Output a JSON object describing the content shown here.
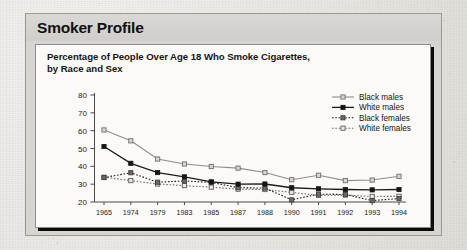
{
  "panel": {
    "title": "Smoker Profile"
  },
  "chart_data": {
    "type": "line",
    "title": "Percentage of People Over Age 18 Who Smoke Cigarettes, by Race and Sex",
    "title_line1": "Percentage of People Over Age 18 Who Smoke Cigarettes,",
    "title_line2": "by Race and Sex",
    "xlabel": "",
    "ylabel": "",
    "ylim": [
      20,
      80
    ],
    "ytick_labels": [
      "80",
      "70",
      "60",
      "50",
      "40",
      "30",
      "20"
    ],
    "yticks": [
      80,
      70,
      60,
      50,
      40,
      30,
      20
    ],
    "grid": false,
    "legend_position": "top-right",
    "categories": [
      "1965",
      "1974",
      "1979",
      "1983",
      "1985",
      "1987",
      "1988",
      "1990",
      "1991",
      "1992",
      "1993",
      "1994"
    ],
    "series": [
      {
        "name": "Black males",
        "marker": "open-square",
        "line": "solid",
        "color": "#8e8d89",
        "values": [
          60.4,
          54.3,
          44.1,
          41.3,
          39.9,
          39.0,
          36.5,
          32.5,
          35.0,
          32.0,
          32.3,
          34.4
        ]
      },
      {
        "name": "White males",
        "marker": "filled-square",
        "line": "solid",
        "color": "#1b1b1b",
        "values": [
          51.1,
          41.7,
          36.5,
          34.1,
          31.3,
          30.0,
          30.1,
          28.0,
          27.4,
          27.0,
          26.8,
          27.0
        ]
      },
      {
        "name": "Black females",
        "marker": "filled-square",
        "line": "dotted",
        "color": "#1b1b1b",
        "values": [
          33.7,
          36.4,
          31.1,
          31.8,
          31.0,
          28.0,
          27.8,
          21.2,
          24.4,
          24.2,
          20.8,
          21.9
        ]
      },
      {
        "name": "White females",
        "marker": "open-square",
        "line": "dotted",
        "color": "#6f6e6a",
        "values": [
          33.9,
          32.0,
          30.1,
          29.2,
          28.3,
          27.2,
          27.0,
          25.4,
          23.7,
          23.9,
          23.1,
          23.2
        ]
      }
    ]
  }
}
